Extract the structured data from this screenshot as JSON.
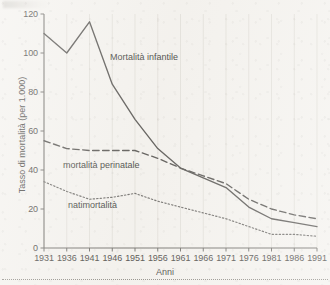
{
  "chart_data": {
    "type": "line",
    "title": "",
    "xlabel": "Anni",
    "ylabel": "Tasso di mortalità (per 1.000)",
    "x": [
      1931,
      1936,
      1941,
      1946,
      1951,
      1956,
      1961,
      1966,
      1971,
      1976,
      1981,
      1986,
      1991
    ],
    "categories": [
      "1931",
      "1936",
      "1941",
      "1946",
      "1951",
      "1956",
      "1961",
      "1966",
      "1971",
      "1976",
      "1981",
      "1986",
      "1991"
    ],
    "xlim": [
      1931,
      1991
    ],
    "ylim": [
      0,
      120
    ],
    "yticks": [
      0,
      20,
      40,
      60,
      80,
      100,
      120
    ],
    "ytick_labels": [
      "0",
      "20",
      "40",
      "60",
      "80",
      "100",
      "120"
    ],
    "grid": "vertical-faint",
    "legend": "inline-annotations",
    "series": [
      {
        "name": "Mortalità infantile",
        "style": "solid",
        "color": "#555350",
        "values": [
          110,
          100,
          116,
          84,
          66,
          51,
          41,
          36,
          31,
          21,
          15,
          13,
          11
        ]
      },
      {
        "name": "mortalità perinatale",
        "style": "dashed",
        "color": "#555350",
        "values": [
          55,
          51,
          50,
          50,
          50,
          46,
          41,
          37,
          33,
          25,
          20,
          17,
          15
        ]
      },
      {
        "name": "natimortalità",
        "style": "dotted",
        "color": "#6b6966",
        "values": [
          34,
          29,
          25,
          26,
          28,
          24,
          21,
          18,
          15,
          11,
          7,
          7,
          6
        ]
      }
    ],
    "annotations": [
      {
        "text": "Mortalità infantile",
        "series": "Mortalità infantile"
      },
      {
        "text": "mortalità perinatale",
        "series": "mortalità perinatale"
      },
      {
        "text": "natimortalità",
        "series": "natimortalità"
      }
    ]
  },
  "colors": {
    "paper": "#f4f2ee",
    "axis": "#6e6c68",
    "grid": "#d8d5cf",
    "ink": "#555350",
    "ink_light": "#6b6966"
  }
}
